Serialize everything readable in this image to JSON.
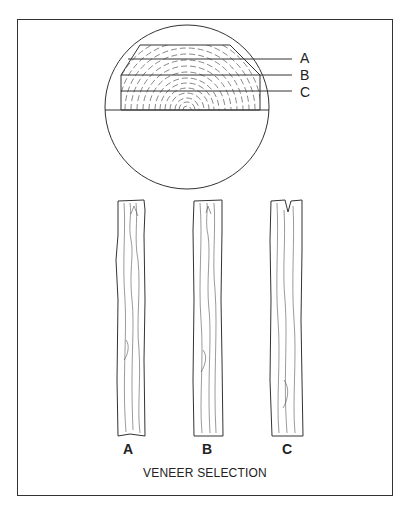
{
  "figure": {
    "caption": "VENEER SELECTION",
    "log_section": {
      "cut_labels": [
        "A",
        "B",
        "C"
      ]
    },
    "boards": [
      {
        "label": "A"
      },
      {
        "label": "B"
      },
      {
        "label": "C"
      }
    ]
  },
  "colors": {
    "line": "#333333",
    "background": "#ffffff"
  }
}
